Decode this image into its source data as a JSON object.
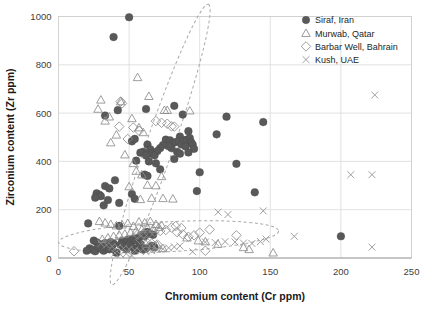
{
  "chart_data": {
    "type": "scatter",
    "title": "",
    "xlabel": "Chromium content (Cr ppm)",
    "ylabel": "Zirconium content (Zr ppm)",
    "xlim": [
      0,
      250
    ],
    "ylim": [
      0,
      1000
    ],
    "xticks": [
      0,
      50,
      100,
      150,
      200,
      250
    ],
    "yticks": [
      0,
      200,
      400,
      600,
      800,
      1000
    ],
    "grid": true,
    "legend_position": "top-right",
    "marker_color": "#595959",
    "grid_color": "#d9d9d9",
    "ellipse_color": "#a9a9a9",
    "series": [
      {
        "name": "Siraf, Iran",
        "marker": "filled-circle",
        "points": [
          [
            50,
            997
          ],
          [
            39,
            915
          ],
          [
            33,
            590
          ],
          [
            42,
            612
          ],
          [
            62,
            617
          ],
          [
            82,
            630
          ],
          [
            88,
            594
          ],
          [
            119,
            585
          ],
          [
            145,
            563
          ],
          [
            112,
            512
          ],
          [
            92,
            525
          ],
          [
            86,
            503
          ],
          [
            52,
            483
          ],
          [
            54,
            493
          ],
          [
            63,
            470
          ],
          [
            65,
            450
          ],
          [
            60,
            440
          ],
          [
            58,
            436
          ],
          [
            66,
            432
          ],
          [
            62,
            424
          ],
          [
            55,
            403
          ],
          [
            64,
            400
          ],
          [
            69,
            392
          ],
          [
            76,
            490
          ],
          [
            79,
            487
          ],
          [
            81,
            476
          ],
          [
            83,
            480
          ],
          [
            85,
            483
          ],
          [
            87,
            470
          ],
          [
            89,
            487
          ],
          [
            91,
            490
          ],
          [
            93,
            497
          ],
          [
            94,
            479
          ],
          [
            90,
            462
          ],
          [
            95,
            470
          ],
          [
            96,
            452
          ],
          [
            92,
            437
          ],
          [
            84,
            440
          ],
          [
            80,
            455
          ],
          [
            78,
            463
          ],
          [
            74,
            468
          ],
          [
            72,
            455
          ],
          [
            70,
            443
          ],
          [
            68,
            425
          ],
          [
            82,
            410
          ],
          [
            86,
            432
          ],
          [
            72,
            367
          ],
          [
            100,
            355
          ],
          [
            126,
            390
          ],
          [
            139,
            272
          ],
          [
            98,
            277
          ],
          [
            27,
            268
          ],
          [
            29,
            262
          ],
          [
            30,
            256
          ],
          [
            26,
            250
          ],
          [
            33,
            298
          ],
          [
            36,
            288
          ],
          [
            40,
            322
          ],
          [
            35,
            240
          ],
          [
            32,
            218
          ],
          [
            43,
            228
          ],
          [
            52,
            265
          ],
          [
            54,
            245
          ],
          [
            61,
            345
          ],
          [
            63,
            340
          ],
          [
            21,
            143
          ],
          [
            43,
            133
          ],
          [
            25,
            72
          ],
          [
            27,
            65
          ],
          [
            29,
            58
          ],
          [
            31,
            48
          ],
          [
            33,
            62
          ],
          [
            35,
            55
          ],
          [
            37,
            66
          ],
          [
            39,
            60
          ],
          [
            41,
            22
          ],
          [
            45,
            70
          ],
          [
            47,
            64
          ],
          [
            49,
            75
          ],
          [
            51,
            68
          ],
          [
            53,
            80
          ],
          [
            55,
            72
          ],
          [
            57,
            86
          ],
          [
            59,
            95
          ],
          [
            61,
            90
          ],
          [
            63,
            108
          ],
          [
            65,
            100
          ],
          [
            67,
            96
          ],
          [
            66,
            50
          ],
          [
            68,
            44
          ],
          [
            62,
            40
          ],
          [
            60,
            35
          ],
          [
            22,
            40
          ],
          [
            24,
            34
          ],
          [
            26,
            28
          ],
          [
            28,
            44
          ],
          [
            30,
            38
          ],
          [
            32,
            30
          ],
          [
            34,
            42
          ],
          [
            36,
            36
          ],
          [
            38,
            52
          ],
          [
            44,
            55
          ],
          [
            46,
            46
          ],
          [
            48,
            36
          ],
          [
            50,
            52
          ],
          [
            52,
            44
          ],
          [
            54,
            30
          ],
          [
            56,
            40
          ],
          [
            58,
            58
          ],
          [
            20,
            30
          ],
          [
            200,
            90
          ]
        ]
      },
      {
        "name": "Murwab, Qatar",
        "marker": "open-triangle",
        "points": [
          [
            56,
            748
          ],
          [
            64,
            670
          ],
          [
            30,
            655
          ],
          [
            44,
            648
          ],
          [
            28,
            617
          ],
          [
            77,
            612
          ],
          [
            93,
            610
          ],
          [
            36,
            585
          ],
          [
            52,
            578
          ],
          [
            33,
            568
          ],
          [
            57,
            540
          ],
          [
            60,
            520
          ],
          [
            41,
            510
          ],
          [
            75,
            612
          ],
          [
            37,
            478
          ],
          [
            47,
            428
          ],
          [
            53,
            392
          ],
          [
            55,
            360
          ],
          [
            59,
            345
          ],
          [
            73,
            338
          ],
          [
            63,
            302
          ],
          [
            69,
            300
          ],
          [
            50,
            296
          ],
          [
            66,
            248
          ],
          [
            74,
            247
          ],
          [
            58,
            243
          ],
          [
            81,
            245
          ],
          [
            29,
            152
          ],
          [
            33,
            146
          ],
          [
            37,
            140
          ],
          [
            41,
            134
          ],
          [
            45,
            138
          ],
          [
            49,
            144
          ],
          [
            53,
            132
          ],
          [
            57,
            150
          ],
          [
            61,
            146
          ],
          [
            65,
            152
          ],
          [
            69,
            140
          ],
          [
            73,
            136
          ],
          [
            71,
            128
          ],
          [
            67,
            120
          ],
          [
            63,
            126
          ],
          [
            59,
            118
          ],
          [
            55,
            112
          ],
          [
            51,
            106
          ],
          [
            47,
            100
          ],
          [
            43,
            96
          ],
          [
            39,
            90
          ],
          [
            35,
            84
          ],
          [
            31,
            78
          ],
          [
            91,
            84
          ],
          [
            99,
            72
          ],
          [
            104,
            68
          ],
          [
            113,
            58
          ],
          [
            131,
            44
          ],
          [
            135,
            36
          ],
          [
            152,
            22
          ],
          [
            62,
            58
          ],
          [
            66,
            46
          ],
          [
            70,
            52
          ],
          [
            74,
            40
          ]
        ]
      },
      {
        "name": "Barbar Well, Bahrain",
        "marker": "open-diamond",
        "points": [
          [
            44,
            648
          ],
          [
            45,
            640
          ],
          [
            43,
            544
          ],
          [
            53,
            540
          ],
          [
            69,
            567
          ],
          [
            73,
            560
          ],
          [
            77,
            556
          ],
          [
            57,
            527
          ],
          [
            80,
            545
          ],
          [
            82,
            544
          ],
          [
            49,
            493
          ],
          [
            11,
            28
          ],
          [
            56,
            97
          ],
          [
            60,
            100
          ],
          [
            64,
            104
          ],
          [
            68,
            108
          ],
          [
            72,
            112
          ],
          [
            76,
            116
          ],
          [
            80,
            126
          ],
          [
            84,
            107
          ],
          [
            88,
            98
          ],
          [
            92,
            88
          ],
          [
            96,
            94
          ],
          [
            100,
            105
          ],
          [
            104,
            30
          ],
          [
            107,
            118
          ],
          [
            126,
            94
          ],
          [
            83,
            132
          ],
          [
            87,
            124
          ],
          [
            58,
            76
          ],
          [
            62,
            68
          ],
          [
            66,
            60
          ],
          [
            70,
            56
          ]
        ]
      },
      {
        "name": "Kush, UAE",
        "marker": "cross",
        "points": [
          [
            224,
            675
          ],
          [
            207,
            345
          ],
          [
            222,
            345
          ],
          [
            113,
            190
          ],
          [
            120,
            180
          ],
          [
            145,
            195
          ],
          [
            167,
            90
          ],
          [
            222,
            45
          ],
          [
            104,
            66
          ],
          [
            111,
            64
          ],
          [
            118,
            68
          ],
          [
            125,
            66
          ],
          [
            131,
            62
          ],
          [
            137,
            60
          ],
          [
            143,
            68
          ],
          [
            147,
            78
          ],
          [
            95,
            26
          ],
          [
            30,
            60
          ],
          [
            34,
            54
          ],
          [
            38,
            48
          ],
          [
            42,
            44
          ],
          [
            46,
            40
          ],
          [
            50,
            36
          ],
          [
            54,
            32
          ],
          [
            58,
            28
          ],
          [
            62,
            26
          ],
          [
            66,
            30
          ],
          [
            70,
            34
          ],
          [
            74,
            38
          ],
          [
            78,
            42
          ],
          [
            82,
            46
          ],
          [
            86,
            50
          ],
          [
            44,
            14
          ],
          [
            48,
            18
          ],
          [
            52,
            10
          ],
          [
            40,
            20
          ]
        ]
      }
    ],
    "annotations": [
      {
        "name": "upper-cluster-ellipse",
        "shape": "ellipse",
        "cx": 72,
        "cy": 470,
        "rx": 105,
        "ry": 57,
        "rotation": -71
      },
      {
        "name": "lower-cluster-ellipse",
        "shape": "ellipse",
        "cx": 78,
        "cy": 88,
        "rx": 78,
        "ry": 62,
        "rotation": -3
      }
    ]
  }
}
